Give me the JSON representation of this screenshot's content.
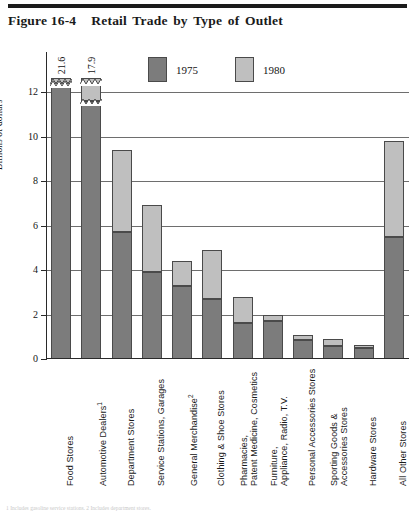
{
  "figure": {
    "number": "Figure 16-4",
    "title": "Retail Trade by Type of Outlet"
  },
  "legend": {
    "entries": [
      {
        "label": "1975",
        "color": "#7c7c7c"
      },
      {
        "label": "1980",
        "color": "#bfbfbf"
      }
    ]
  },
  "axis": {
    "y_title": "Billions of dollars",
    "ticks": [
      "0",
      "2",
      "4",
      "6",
      "8",
      "10",
      "12"
    ]
  },
  "footnote": {
    "text": "1 Includes gasoline service stations.  2 Includes department stores."
  },
  "chart_data": {
    "type": "bar",
    "title": "Retail Trade by Type of Outlet",
    "subtype": "stacked-overlay two-series vertical bars",
    "xlabel": "",
    "ylabel": "Billions of dollars",
    "ylim": [
      0,
      12
    ],
    "y_ticks": [
      0,
      2,
      4,
      6,
      8,
      10,
      12
    ],
    "grid": true,
    "legend_position": "top-center",
    "axis_broken": true,
    "axis_break_note": "Bars for Food Stores and Automotive Dealers exceed the 12 axis maximum and are drawn truncated with a jagged break; their totals are printed above the bars.",
    "categories": [
      "Food Stores",
      "Automotive Dealers",
      "Department Stores",
      "Service Stations, Garages",
      "General Merchandise",
      "Clothing & Shoe Stores",
      "Pharmacies, Patent Medicine, Cosmetics",
      "Furniture, Appliance, Radio, T.V.",
      "Personal Accessories Stores",
      "Sporting Goods & Accessories Stores",
      "Hardware Stores",
      "All Other Stores"
    ],
    "category_labels": [
      {
        "line1": "Food Stores",
        "line2": "",
        "footnote_marker": ""
      },
      {
        "line1": "Automotive Dealers",
        "line2": "",
        "footnote_marker": "1"
      },
      {
        "line1": "Department Stores",
        "line2": "",
        "footnote_marker": ""
      },
      {
        "line1": "Service Stations, Garages",
        "line2": "",
        "footnote_marker": ""
      },
      {
        "line1": "General Merchandise",
        "line2": "",
        "footnote_marker": "2"
      },
      {
        "line1": "Clothing & Shoe Stores",
        "line2": "",
        "footnote_marker": ""
      },
      {
        "line1": "Pharmacies,",
        "line2": "Patent Medicine, Cosmetics",
        "footnote_marker": ""
      },
      {
        "line1": "Furniture,",
        "line2": "Appliance, Radio, T.V.",
        "footnote_marker": ""
      },
      {
        "line1": "Personal Accessories Stores",
        "line2": "",
        "footnote_marker": ""
      },
      {
        "line1": "Sporting Goods &",
        "line2": "Accessories Stores",
        "footnote_marker": ""
      },
      {
        "line1": "Hardware Stores",
        "line2": "",
        "footnote_marker": ""
      },
      {
        "line1": "All Other Stores",
        "line2": "",
        "footnote_marker": ""
      }
    ],
    "series": [
      {
        "name": "1975",
        "color": "#7c7c7c",
        "values": [
          12.4,
          11.6,
          5.7,
          3.9,
          3.3,
          2.7,
          1.6,
          1.7,
          0.85,
          0.6,
          0.5,
          5.5
        ]
      },
      {
        "name": "1980",
        "color": "#bfbfbf",
        "values": [
          21.6,
          17.9,
          9.4,
          6.9,
          4.4,
          4.9,
          2.8,
          2.0,
          1.1,
          0.9,
          0.65,
          9.8
        ]
      }
    ],
    "value_labels": [
      {
        "category": "Food Stores",
        "series": "1980",
        "text": "21.6"
      },
      {
        "category": "Automotive Dealers",
        "series": "1980",
        "text": "17.9"
      }
    ]
  }
}
